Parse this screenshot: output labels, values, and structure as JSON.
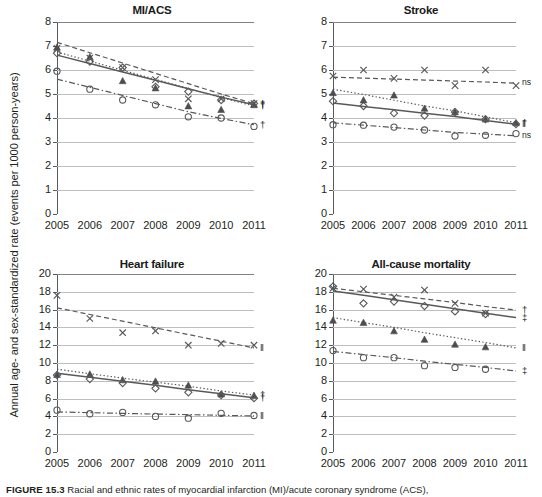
{
  "figure": {
    "y_axis_label": "Annual age- and sex-standardized rate (events per 1000 person-years)",
    "caption_label": "FIGURE 15.3",
    "caption_text": "Racial and ethnic rates of myocardial infarction (MI)/acute coronary syndrome (ACS),"
  },
  "chart_data": [
    {
      "type": "line",
      "title": "MI/ACS",
      "xlabel": "",
      "ylabel": "Annual age- and sex-standardized rate (events per 1000 person-years)",
      "x": [
        2005,
        2006,
        2007,
        2008,
        2009,
        2010,
        2011
      ],
      "xlim": [
        2005,
        2011
      ],
      "ylim": [
        0,
        8
      ],
      "yticks": [
        0,
        1,
        2,
        3,
        4,
        5,
        6,
        7,
        8
      ],
      "xticks": [
        "2005",
        "2006",
        "2007",
        "2008",
        "2009",
        "2010",
        "2011"
      ],
      "grid": true,
      "legend": "none",
      "series": [
        {
          "name": "x-series",
          "marker": "x",
          "linestyle": "dashed",
          "values": [
            6.9,
            6.5,
            6.1,
            5.6,
            4.8,
            4.8,
            4.6
          ],
          "trend": [
            7.15,
            6.72,
            6.29,
            5.86,
            5.43,
            5.0,
            4.6
          ],
          "annotation": "†"
        },
        {
          "name": "triangle-series",
          "marker": "triangle",
          "linestyle": "dotted",
          "values": [
            6.95,
            6.55,
            5.55,
            5.25,
            4.5,
            4.35,
            4.55
          ],
          "trend": [
            6.75,
            6.37,
            5.99,
            5.61,
            5.23,
            4.85,
            4.5
          ],
          "annotation": "†"
        },
        {
          "name": "diamond-series",
          "marker": "diamond",
          "linestyle": "solid",
          "values": [
            6.7,
            6.35,
            6.1,
            5.3,
            5.1,
            4.75,
            4.6
          ],
          "trend": [
            6.62,
            6.27,
            5.92,
            5.57,
            5.22,
            4.87,
            4.55
          ],
          "annotation": "†"
        },
        {
          "name": "circle-series",
          "marker": "circle",
          "linestyle": "dashdot",
          "values": [
            5.95,
            5.2,
            4.75,
            4.55,
            4.05,
            4.0,
            3.65
          ],
          "trend": [
            5.62,
            5.28,
            4.94,
            4.6,
            4.26,
            3.98,
            3.72
          ],
          "annotation": "†"
        }
      ]
    },
    {
      "type": "line",
      "title": "Stroke",
      "xlabel": "",
      "ylabel": "",
      "x": [
        2005,
        2006,
        2007,
        2008,
        2009,
        2010,
        2011
      ],
      "xlim": [
        2005,
        2011
      ],
      "ylim": [
        0,
        8
      ],
      "yticks": [
        0,
        1,
        2,
        3,
        4,
        5,
        6,
        7,
        8
      ],
      "xticks": [
        "2005",
        "2006",
        "2007",
        "2008",
        "2009",
        "2010",
        "2011"
      ],
      "grid": true,
      "legend": "none",
      "series": [
        {
          "name": "x-series",
          "marker": "x",
          "linestyle": "dashed",
          "values": [
            5.75,
            6.0,
            5.65,
            6.0,
            5.35,
            6.0,
            5.35
          ],
          "trend": [
            5.7,
            5.66,
            5.62,
            5.58,
            5.54,
            5.5,
            5.45
          ],
          "annotation": "ns"
        },
        {
          "name": "triangle-series",
          "marker": "triangle",
          "linestyle": "dotted",
          "values": [
            5.05,
            4.75,
            4.95,
            4.4,
            4.25,
            3.95,
            3.8
          ],
          "trend": [
            5.2,
            4.98,
            4.74,
            4.5,
            4.3,
            4.05,
            3.8
          ],
          "annotation": "†"
        },
        {
          "name": "diamond-series",
          "marker": "diamond",
          "linestyle": "solid",
          "values": [
            4.7,
            4.5,
            4.2,
            4.1,
            4.25,
            3.95,
            3.75
          ],
          "trend": [
            4.62,
            4.48,
            4.34,
            4.2,
            4.06,
            3.9,
            3.74
          ],
          "annotation": "‖"
        },
        {
          "name": "circle-series",
          "marker": "circle",
          "linestyle": "dashdot",
          "values": [
            3.72,
            3.7,
            3.62,
            3.5,
            3.25,
            3.28,
            3.35
          ],
          "trend": [
            3.8,
            3.7,
            3.6,
            3.5,
            3.4,
            3.33,
            3.26
          ],
          "annotation": "ns"
        }
      ]
    },
    {
      "type": "line",
      "title": "Heart failure",
      "xlabel": "",
      "ylabel": "",
      "x": [
        2005,
        2006,
        2007,
        2008,
        2009,
        2010,
        2011
      ],
      "xlim": [
        2005,
        2011
      ],
      "ylim": [
        0,
        20
      ],
      "yticks": [
        0,
        2,
        4,
        6,
        8,
        10,
        12,
        14,
        16,
        18,
        20
      ],
      "xticks": [
        "2005",
        "2006",
        "2007",
        "2008",
        "2009",
        "2010",
        "2011"
      ],
      "grid": true,
      "legend": "none",
      "series": [
        {
          "name": "x-series",
          "marker": "x",
          "linestyle": "dashed",
          "values": [
            17.6,
            15.0,
            13.4,
            13.6,
            12.0,
            12.2,
            12.0
          ],
          "trend": [
            16.2,
            15.45,
            14.7,
            13.95,
            13.2,
            12.45,
            11.7
          ],
          "annotation": "‖"
        },
        {
          "name": "triangle-series",
          "marker": "triangle",
          "linestyle": "dotted",
          "values": [
            8.7,
            8.75,
            8.1,
            7.95,
            7.5,
            6.5,
            6.35
          ],
          "trend": [
            9.3,
            8.8,
            8.3,
            7.85,
            7.4,
            6.85,
            6.4
          ],
          "annotation": "†"
        },
        {
          "name": "diamond-series",
          "marker": "diamond",
          "linestyle": "solid",
          "values": [
            8.65,
            8.2,
            7.75,
            7.15,
            6.7,
            6.4,
            6.05
          ],
          "trend": [
            8.85,
            8.4,
            7.95,
            7.5,
            7.0,
            6.55,
            6.1
          ],
          "annotation": "†"
        },
        {
          "name": "circle-series",
          "marker": "circle",
          "linestyle": "dashdot",
          "values": [
            4.7,
            4.3,
            4.45,
            4.0,
            3.8,
            4.35,
            4.1
          ],
          "trend": [
            4.5,
            4.42,
            4.34,
            4.26,
            4.2,
            4.12,
            4.05
          ],
          "annotation": "‖"
        }
      ]
    },
    {
      "type": "line",
      "title": "All-cause mortality",
      "xlabel": "",
      "ylabel": "",
      "x": [
        2005,
        2006,
        2007,
        2008,
        2009,
        2010,
        2011
      ],
      "xlim": [
        2005,
        2011
      ],
      "ylim": [
        0,
        20
      ],
      "yticks": [
        0,
        2,
        4,
        6,
        8,
        10,
        12,
        14,
        16,
        18,
        20
      ],
      "xticks": [
        "2005",
        "2006",
        "2007",
        "2008",
        "2009",
        "2010",
        "2011"
      ],
      "grid": true,
      "legend": "none",
      "series": [
        {
          "name": "x-series",
          "marker": "x",
          "linestyle": "dashed",
          "values": [
            18.4,
            18.3,
            17.4,
            18.2,
            16.7,
            15.6,
            null
          ],
          "trend": [
            18.4,
            18.0,
            17.6,
            17.2,
            16.8,
            16.35,
            15.95
          ],
          "annotation": "†"
        },
        {
          "name": "diamond-series",
          "marker": "diamond",
          "linestyle": "solid",
          "values": [
            18.6,
            16.7,
            16.9,
            16.4,
            15.8,
            15.5,
            null
          ],
          "trend": [
            18.1,
            17.6,
            17.1,
            16.6,
            16.1,
            15.6,
            15.1
          ],
          "annotation": "‡"
        },
        {
          "name": "triangle-series",
          "marker": "triangle",
          "linestyle": "dotted",
          "values": [
            14.8,
            14.55,
            13.6,
            12.65,
            12.1,
            11.8,
            null
          ],
          "trend": [
            15.1,
            14.55,
            14.0,
            13.4,
            12.85,
            12.3,
            11.7
          ],
          "annotation": "‖"
        },
        {
          "name": "circle-series",
          "marker": "circle",
          "linestyle": "dashdot",
          "values": [
            11.4,
            10.6,
            10.6,
            9.7,
            9.5,
            9.3,
            null
          ],
          "trend": [
            11.3,
            10.95,
            10.6,
            10.2,
            9.85,
            9.5,
            9.1
          ],
          "annotation": "‡"
        }
      ]
    }
  ],
  "panels": [
    {
      "title": "MI/ACS",
      "annotations": [
        "†",
        "†",
        "†",
        "†"
      ]
    },
    {
      "title": "Stroke",
      "annotations": [
        "ns",
        "†",
        "‖",
        "ns"
      ]
    },
    {
      "title": "Heart failure",
      "annotations": [
        "‖",
        "†",
        "†",
        "‖"
      ]
    },
    {
      "title": "All-cause mortality",
      "annotations": [
        "†",
        "‡",
        "‖",
        "‡"
      ]
    }
  ],
  "axis_ticks": {
    "years": [
      "2005",
      "2006",
      "2007",
      "2008",
      "2009",
      "2010",
      "2011"
    ],
    "scale8": [
      "0",
      "1",
      "2",
      "3",
      "4",
      "5",
      "6",
      "7",
      "8"
    ],
    "scale20": [
      "0",
      "2",
      "4",
      "6",
      "8",
      "10",
      "12",
      "14",
      "16",
      "18",
      "20"
    ]
  },
  "colors": {
    "line": "#58595b",
    "grid": "#bcbec0",
    "text": "#231f20"
  }
}
